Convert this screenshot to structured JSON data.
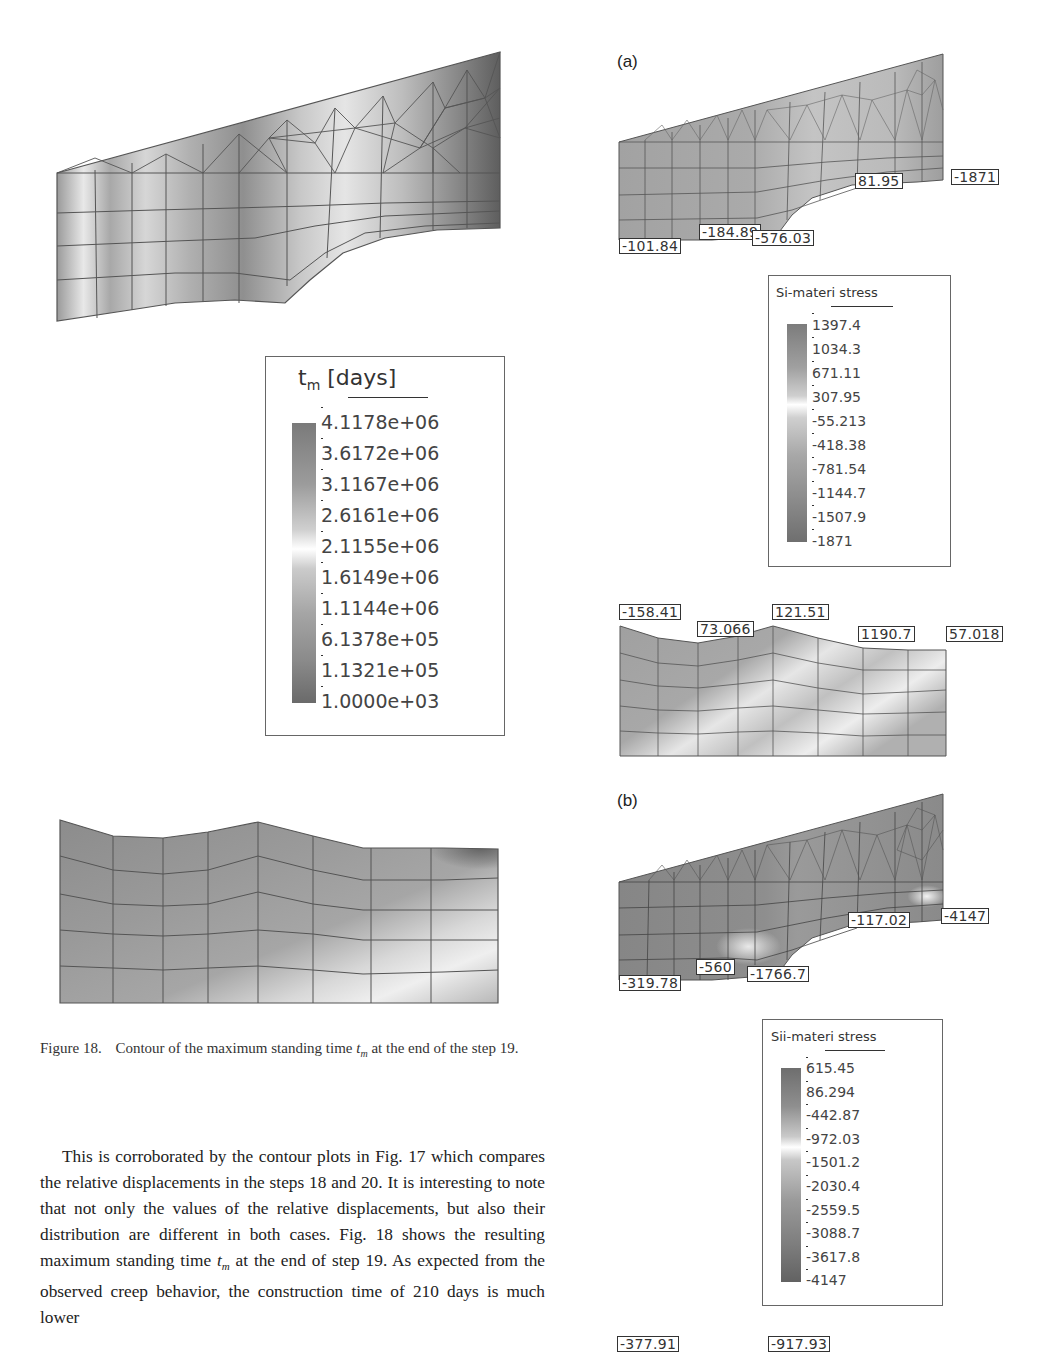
{
  "figure18": {
    "caption_number": "Figure 18.",
    "caption_text_before": "Contour of the maximum standing time",
    "caption_symbol": "t",
    "caption_symbol_sub": "m",
    "caption_text_after": "at the end of the step 19.",
    "legend": {
      "title_main": "t",
      "title_sub": "m",
      "title_unit": " [days]",
      "values": [
        "4.1178e+06",
        "3.6172e+06",
        "3.1167e+06",
        "2.6161e+06",
        "2.1155e+06",
        "1.6149e+06",
        "1.1144e+06",
        "6.1378e+05",
        "1.1321e+05",
        "1.0000e+03"
      ]
    }
  },
  "panel_a": {
    "label": "(a)",
    "top_mesh_tags": [
      "81.95",
      "-1871",
      "-184.89",
      "-576.03",
      "-101.84"
    ],
    "legend": {
      "title": "Si-materi stress",
      "values": [
        "1397.4",
        "1034.3",
        "671.11",
        "307.95",
        "-55.213",
        "-418.38",
        "-781.54",
        "-1144.7",
        "-1507.9",
        "-1871"
      ]
    },
    "bottom_mesh_tags": [
      "-158.41",
      "73.066",
      "121.51",
      "1190.7",
      "57.018"
    ]
  },
  "panel_b": {
    "label": "(b)",
    "top_mesh_tags": [
      "-117.02",
      "-4147",
      "-560",
      "-1766.7",
      "-319.78"
    ],
    "legend": {
      "title": "Sii-materi stress",
      "values": [
        "615.45",
        "86.294",
        "-442.87",
        "-972.03",
        "-1501.2",
        "-2030.4",
        "-2559.5",
        "-3088.7",
        "-3617.8",
        "-4147"
      ]
    },
    "bottom_mesh_tags": [
      "-377.91",
      "-917.93"
    ]
  },
  "body_text": {
    "paragraph_parts": [
      "This is corroborated by the contour plots in Fig. 17 which compares the relative displacements in the steps 18 and 20. It is interesting to note that not only the values of the relative displacements, but also their distribution are different in both cases. Fig. 18 shows the resulting maximum standing time ",
      "t",
      "m",
      " at the end of step 19. As expected from the observed creep behavior, the construction time of 210 days is much lower"
    ]
  }
}
